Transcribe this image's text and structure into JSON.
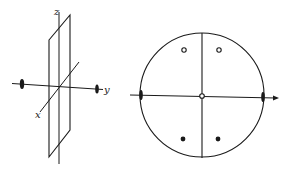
{
  "figure": {
    "left_panel": {
      "description": "3D coordinate axes with a mirror plane containing the z-axis",
      "labels": {
        "z": "z",
        "y": "y",
        "x": "x"
      },
      "two_fold_axis_markers": 2
    },
    "right_panel": {
      "description": "Stereographic projection with mirror plane and 2-fold axis",
      "open_circles": 2,
      "filled_dots": 2,
      "two_fold_axis_markers": 2,
      "center_marker": "open-circle"
    },
    "colors": {
      "line": "#1a1a1a",
      "background": "#ffffff"
    }
  }
}
